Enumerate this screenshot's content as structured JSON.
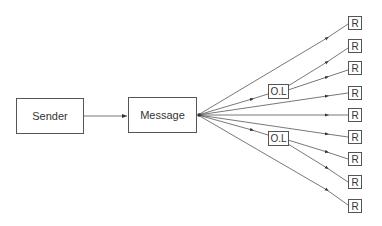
{
  "diagram": {
    "type": "message-broadcast-flow",
    "colors": {
      "stroke": "#555555",
      "text": "#333333",
      "background": "#ffffff"
    },
    "nodes": {
      "sender": {
        "label": "Sender",
        "x": 16,
        "y": 98,
        "w": 68,
        "h": 36
      },
      "message": {
        "label": "Message",
        "x": 128,
        "y": 97,
        "w": 69,
        "h": 36
      },
      "ol_upper": {
        "label": "O.L",
        "x": 268,
        "y": 84,
        "w": 21,
        "h": 15
      },
      "ol_lower": {
        "label": "O.L",
        "x": 268,
        "y": 131,
        "w": 21,
        "h": 15
      },
      "receivers": [
        {
          "label": "R",
          "x": 348,
          "y": 16,
          "w": 14,
          "h": 14
        },
        {
          "label": "R",
          "x": 348,
          "y": 39,
          "w": 14,
          "h": 14
        },
        {
          "label": "R",
          "x": 348,
          "y": 61,
          "w": 14,
          "h": 14
        },
        {
          "label": "R",
          "x": 348,
          "y": 86,
          "w": 14,
          "h": 14
        },
        {
          "label": "R",
          "x": 348,
          "y": 108,
          "w": 14,
          "h": 14
        },
        {
          "label": "R",
          "x": 348,
          "y": 130,
          "w": 14,
          "h": 14
        },
        {
          "label": "R",
          "x": 348,
          "y": 152,
          "w": 14,
          "h": 14
        },
        {
          "label": "R",
          "x": 348,
          "y": 175,
          "w": 14,
          "h": 14
        },
        {
          "label": "R",
          "x": 348,
          "y": 199,
          "w": 14,
          "h": 14
        }
      ]
    },
    "edges": [
      {
        "from": "sender",
        "to": "message"
      },
      {
        "from": "message",
        "to": "R1"
      },
      {
        "from": "message",
        "to": "O.L (upper)"
      },
      {
        "from": "O.L (upper)",
        "to": "R2"
      },
      {
        "from": "O.L (upper)",
        "to": "R3"
      },
      {
        "from": "message",
        "to": "R4"
      },
      {
        "from": "message",
        "to": "R5"
      },
      {
        "from": "message",
        "to": "R6"
      },
      {
        "from": "message",
        "to": "O.L (lower)"
      },
      {
        "from": "O.L (lower)",
        "to": "R7"
      },
      {
        "from": "O.L (lower)",
        "to": "R8"
      },
      {
        "from": "message",
        "to": "R9"
      }
    ]
  }
}
